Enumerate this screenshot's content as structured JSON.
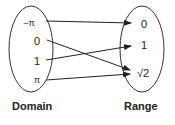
{
  "diagram": {
    "domain": {
      "title": "Domain",
      "elements": [
        "−π",
        "0",
        "1",
        "π"
      ]
    },
    "range": {
      "title": "Range",
      "elements": [
        "0",
        "1",
        "√2"
      ]
    },
    "mappings": [
      {
        "from": "−π",
        "to": "0"
      },
      {
        "from": "0",
        "to": "√2"
      },
      {
        "from": "1",
        "to": "1"
      },
      {
        "from": "π",
        "to": "√2"
      }
    ],
    "colors": {
      "stroke": "#222222",
      "background": "#ffffff"
    }
  }
}
